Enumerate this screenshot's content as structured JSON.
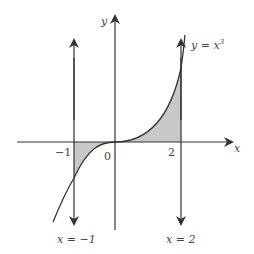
{
  "diagram": {
    "axes": {
      "x_label": "x",
      "y_label": "y"
    },
    "tick_labels": {
      "neg_one": "−1",
      "zero": "0",
      "two": "2"
    },
    "curve_label": {
      "lhs": "y = x",
      "exp": "3"
    },
    "vertical_lines": [
      {
        "label": "x = −1"
      },
      {
        "label": "x = 2"
      }
    ],
    "colors": {
      "stroke": "#333333",
      "shade": "#c8c8c8"
    }
  }
}
